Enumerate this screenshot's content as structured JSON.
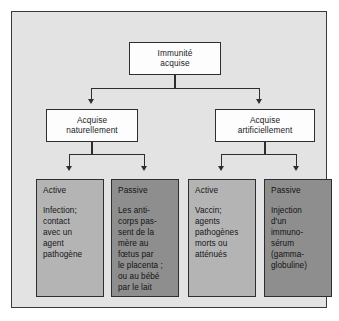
{
  "diagram": {
    "root": {
      "line1": "Immunité",
      "line2": "acquise"
    },
    "branches": [
      {
        "line1": "Acquise",
        "line2": "naturellement"
      },
      {
        "line1": "Acquise",
        "line2": "artificiellement"
      }
    ],
    "leaves": [
      {
        "title": "Active",
        "shade": "light",
        "body_lines": [
          "Infection;",
          "contact",
          "avec un",
          "agent",
          "pathogène"
        ]
      },
      {
        "title": "Passive",
        "shade": "dark",
        "body_lines": [
          "Les anti-",
          "corps pas-",
          "sent de la",
          "mère au",
          "fœtus par",
          "le placenta ;",
          "ou au bébé",
          "par le lait"
        ]
      },
      {
        "title": "Active",
        "shade": "light",
        "body_lines": [
          "Vaccin;",
          "agents",
          "pathogènes",
          "morts ou",
          "atténués"
        ]
      },
      {
        "title": "Passive",
        "shade": "dark",
        "body_lines": [
          "Injection",
          "d'un",
          "immuno-",
          "sérum",
          "(gamma-",
          "globuline)"
        ]
      }
    ],
    "colors": {
      "panel_background": "#e3e3e3",
      "panel_border": "#3a3a3a",
      "box_white": "#fdfdfd",
      "box_light_gray": "#b4b4b4",
      "box_dark_gray": "#8e8e8e",
      "line": "#2e2e2e",
      "text": "#141414"
    }
  }
}
